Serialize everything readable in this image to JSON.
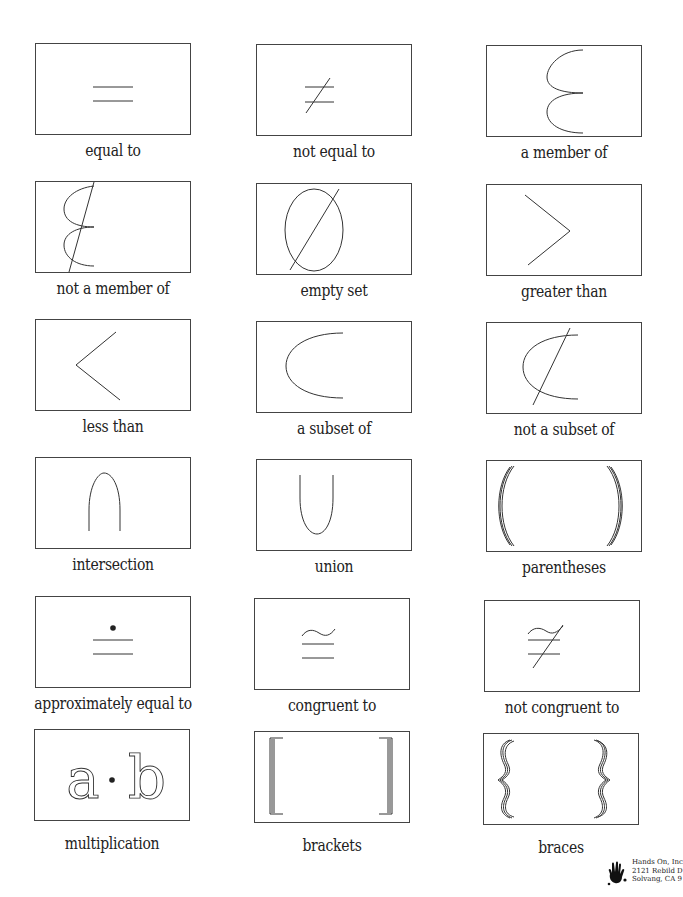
{
  "worksheet": {
    "cards": [
      {
        "label": "equal to",
        "symbol": "equal"
      },
      {
        "label": "not equal to",
        "symbol": "not-equal"
      },
      {
        "label": "a member of",
        "symbol": "member-of"
      },
      {
        "label": "not a member of",
        "symbol": "not-member-of"
      },
      {
        "label": "empty set",
        "symbol": "empty-set"
      },
      {
        "label": "greater than",
        "symbol": "greater-than"
      },
      {
        "label": "less than",
        "symbol": "less-than"
      },
      {
        "label": "a subset of",
        "symbol": "subset-of"
      },
      {
        "label": "not a subset of",
        "symbol": "not-subset-of"
      },
      {
        "label": "intersection",
        "symbol": "intersection"
      },
      {
        "label": "union",
        "symbol": "union"
      },
      {
        "label": "parentheses",
        "symbol": "parentheses"
      },
      {
        "label": "approximately equal to",
        "symbol": "approx-equal"
      },
      {
        "label": "congruent to",
        "symbol": "congruent"
      },
      {
        "label": "not congruent to",
        "symbol": "not-congruent"
      },
      {
        "label": "multiplication",
        "symbol": "multiplication",
        "glyph_a": "a",
        "glyph_dot": "·",
        "glyph_b": "b"
      },
      {
        "label": "brackets",
        "symbol": "brackets"
      },
      {
        "label": "braces",
        "symbol": "braces"
      }
    ]
  },
  "footer": {
    "publisher_line1": "Hands On, Inc",
    "publisher_line2": "2121 Rebild D",
    "publisher_line3": "Solvang, CA 9"
  },
  "colors": {
    "ink": "#222222",
    "border": "#444444",
    "background": "#ffffff"
  }
}
